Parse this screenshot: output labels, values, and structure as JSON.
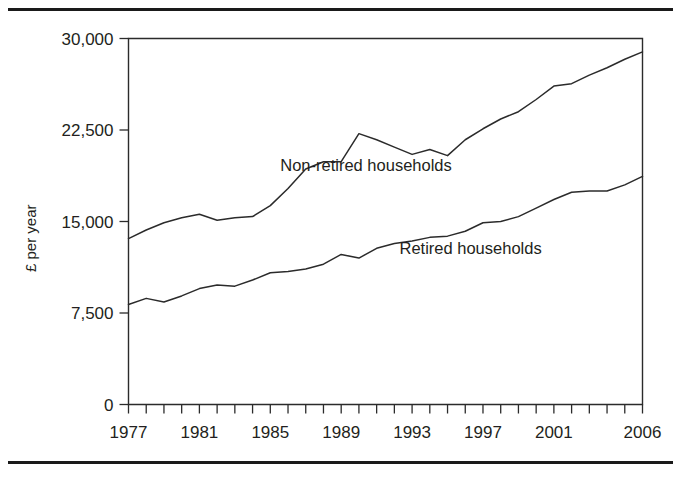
{
  "figure": {
    "top_rule": "horizontal-rule",
    "bottom_rule": "horizontal-rule"
  },
  "chart_data": {
    "type": "line",
    "title": "",
    "subtitle": "",
    "xlabel": "",
    "ylabel": "£ per year",
    "ylim": [
      0,
      30000
    ],
    "xlim": [
      1977,
      2006
    ],
    "grid": false,
    "legend_position": "inline-annotation",
    "y_ticks": [
      0,
      7500,
      15000,
      22500,
      30000
    ],
    "y_tick_labels": [
      "0",
      "7,500",
      "15,000",
      "22,500",
      "30,000"
    ],
    "x_ticks": [
      1977,
      1981,
      1985,
      1989,
      1993,
      1997,
      2001,
      2006
    ],
    "x_tick_labels": [
      "1977",
      "1981",
      "1985",
      "1989",
      "1993",
      "1997",
      "2001",
      "2006"
    ],
    "x_all_years": [
      1977,
      1978,
      1979,
      1980,
      1981,
      1982,
      1983,
      1984,
      1985,
      1986,
      1987,
      1988,
      1989,
      1990,
      1991,
      1992,
      1993,
      1994,
      1995,
      1996,
      1997,
      1998,
      1999,
      2000,
      2001,
      2002,
      2003,
      2004,
      2005,
      2006
    ],
    "series": [
      {
        "name": "Non-retired households",
        "label_text": "Non-retired households",
        "values": [
          13600,
          14300,
          14900,
          15300,
          15600,
          15100,
          15300,
          15400,
          16300,
          17700,
          19300,
          19900,
          19900,
          22200,
          21700,
          21100,
          20500,
          20900,
          20400,
          21700,
          22600,
          23400,
          24000,
          25000,
          26100,
          26300,
          27000,
          27600,
          28300,
          28900
        ]
      },
      {
        "name": "Retired households",
        "label_text": "Retired households",
        "values": [
          8200,
          8700,
          8400,
          8900,
          9500,
          9800,
          9700,
          10200,
          10800,
          10900,
          11100,
          11500,
          12300,
          12000,
          12800,
          13200,
          13400,
          13700,
          13800,
          14200,
          14900,
          15000,
          15400,
          16100,
          16800,
          17400,
          17500,
          17500,
          18000,
          18700
        ]
      }
    ],
    "annotations": [
      {
        "text": "Non-retired households",
        "at_x": 1990.4,
        "at_y": 19100
      },
      {
        "text": "Retired households",
        "at_x": 1996.3,
        "at_y": 12350
      }
    ]
  }
}
